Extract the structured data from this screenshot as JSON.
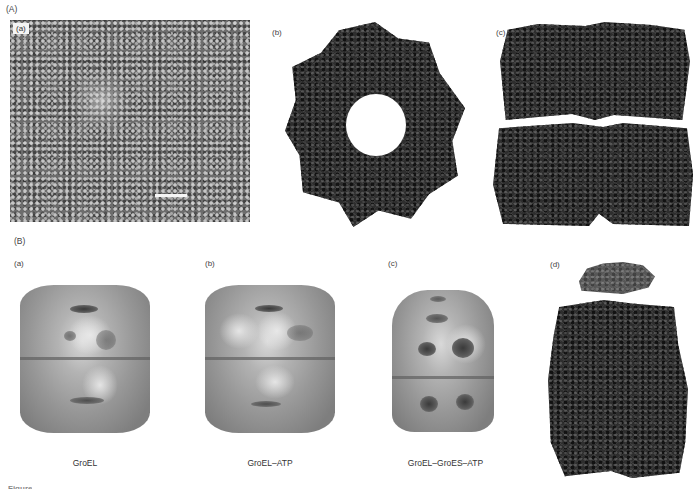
{
  "figure": {
    "section_A": {
      "label": "(A)",
      "panels": [
        {
          "label": "(a)",
          "kind": "electron-micrograph",
          "has_scale_bar": true
        },
        {
          "label": "(b)",
          "kind": "ribbon-structure-top-view"
        },
        {
          "label": "(c)",
          "kind": "ribbon-structure-side-view"
        }
      ]
    },
    "section_B": {
      "label": "(B)",
      "panels": [
        {
          "label": "(a)",
          "kind": "surface-rendering",
          "caption": "GroEL"
        },
        {
          "label": "(b)",
          "kind": "surface-rendering",
          "caption": "GroEL–ATP"
        },
        {
          "label": "(c)",
          "kind": "surface-rendering",
          "caption": "GroEL–GroES–ATP"
        },
        {
          "label": "(d)",
          "kind": "ribbon-structure-complex"
        }
      ]
    },
    "caption_fragment": "Figure",
    "colors": {
      "background": "#ffffff",
      "micrograph_gray": "#6d6d6d",
      "ribbon_dark": "#2e2e2e",
      "surface_gray": "#9a9a9a"
    }
  }
}
